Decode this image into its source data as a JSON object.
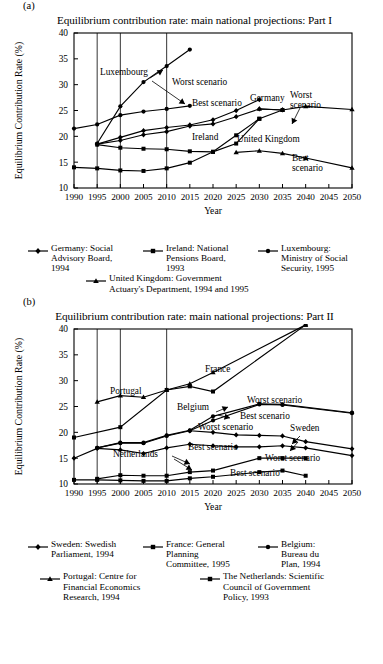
{
  "panels": [
    {
      "letter": "(a)",
      "title": "Equilibrium contribution rate: main national projections: Part I",
      "xlabel": "Year",
      "ylabel": "Equilibrium Contribution Rate (%)"
    },
    {
      "letter": "(b)",
      "title": "Equilibrium contribution rate: main national projections: Part II",
      "xlabel": "Year",
      "ylabel": "Equilibrium Contribution Rate (%)"
    }
  ],
  "chart_data": [
    {
      "type": "line",
      "title": "Equilibrium contribution rate: main national projections: Part I",
      "xlabel": "Year",
      "ylabel": "Equilibrium Contribution Rate (%)",
      "xlim": [
        1990,
        2050
      ],
      "ylim": [
        10,
        40
      ],
      "xticks": [
        1990,
        1995,
        2000,
        2005,
        2010,
        2015,
        2020,
        2025,
        2030,
        2035,
        2040,
        2045,
        2050
      ],
      "yticks": [
        10,
        15,
        20,
        25,
        30,
        35,
        40
      ],
      "gridlines_x": [
        1995,
        2000,
        2010
      ],
      "grid": "vertical-only",
      "legend_position": "below",
      "series": [
        {
          "name": "Germany: Social Advisory Board, 1994 — Worst scenario",
          "marker": "diamond",
          "x": [
            1995,
            2000,
            2005,
            2010,
            2015,
            2020,
            2025,
            2030
          ],
          "y": [
            18.5,
            19.8,
            21.1,
            21.7,
            22.2,
            23.2,
            25.0,
            27.1
          ]
        },
        {
          "name": "Germany: Social Advisory Board, 1994 — Best scenario",
          "marker": "diamond",
          "x": [
            1995,
            2000,
            2005,
            2010,
            2015,
            2020,
            2025,
            2030,
            2035
          ],
          "y": [
            18.5,
            19.2,
            20.3,
            20.9,
            22.0,
            22.4,
            23.8,
            25.3,
            25.1
          ]
        },
        {
          "name": "Ireland: National Pensions Board, 1993 — upper",
          "marker": "square",
          "x": [
            1995,
            2000,
            2005,
            2010,
            2015,
            2020,
            2025,
            2030,
            2035
          ],
          "y": [
            18.4,
            17.8,
            17.6,
            17.5,
            17.1,
            17.0,
            18.6,
            23.4,
            25.1
          ]
        },
        {
          "name": "Ireland: National Pensions Board, 1993 — lower",
          "marker": "square",
          "x": [
            1990,
            1995,
            2000,
            2005,
            2010,
            2015,
            2020,
            2025,
            2030
          ],
          "y": [
            14.0,
            13.8,
            13.4,
            13.3,
            13.8,
            14.9,
            17.0,
            20.2,
            23.4
          ]
        },
        {
          "name": "Luxembourg: Ministry of Social Security, 1995 — Worst scenario",
          "marker": "circle",
          "x": [
            1995,
            2000,
            2005,
            2010,
            2015
          ],
          "y": [
            18.6,
            25.8,
            30.5,
            33.6,
            36.8
          ]
        },
        {
          "name": "Luxembourg: Ministry of Social Security, 1995 — Best scenario",
          "marker": "circle",
          "x": [
            1990,
            1995,
            2000,
            2005,
            2010,
            2015
          ],
          "y": [
            21.5,
            22.3,
            24.1,
            24.8,
            25.3,
            25.9
          ]
        },
        {
          "name": "United Kingdom: Government Actuary's Department, 1994 and 1995 — Worst scenario",
          "marker": "triangle",
          "x": [
            2030,
            2035,
            2040,
            2050
          ],
          "y": [
            25.3,
            25.1,
            25.8,
            25.2
          ]
        },
        {
          "name": "United Kingdom: Government Actuary's Department, 1994 and 1995 — Best scenario",
          "marker": "triangle",
          "x": [
            2025,
            2030,
            2035,
            2040,
            2050
          ],
          "y": [
            16.9,
            17.2,
            16.7,
            15.8,
            13.9
          ]
        }
      ],
      "annotations": [
        "Luxembourg",
        "Worst scenario",
        "Best scenario",
        "Germany",
        "Ireland",
        "United Kingdom",
        "Worst scenario",
        "Best scenario"
      ]
    },
    {
      "type": "line",
      "title": "Equilibrium contribution rate: main national projections: Part II",
      "xlabel": "Year",
      "ylabel": "Equilibrium Contribution Rate (%)",
      "xlim": [
        1990,
        2050
      ],
      "ylim": [
        10,
        40
      ],
      "xticks": [
        1990,
        1995,
        2000,
        2005,
        2010,
        2015,
        2020,
        2025,
        2030,
        2035,
        2040,
        2045,
        2050
      ],
      "yticks": [
        10,
        15,
        20,
        25,
        30,
        35,
        40
      ],
      "gridlines_x": [
        1995,
        2000,
        2010
      ],
      "grid": "vertical-only",
      "legend_position": "below",
      "series": [
        {
          "name": "France: General Planning Committee, 1995",
          "marker": "square",
          "x": [
            1990,
            2000,
            2010,
            2015,
            2020,
            2040
          ],
          "y": [
            19.0,
            21.0,
            28.2,
            28.9,
            27.9,
            40.8
          ]
        },
        {
          "name": "Portugal: Centre for Financial Economics Research, 1994",
          "marker": "triangle",
          "x": [
            1995,
            2000,
            2005,
            2010,
            2015,
            2020,
            2040
          ],
          "y": [
            25.9,
            27.1,
            26.8,
            28.2,
            29.4,
            31.6,
            40.8
          ]
        },
        {
          "name": "Belgium: Bureau du Plan, 1994 — Worst scenario",
          "marker": "circle",
          "x": [
            1995,
            2000,
            2005,
            2010,
            2015,
            2020,
            2030,
            2035,
            2050
          ],
          "y": [
            17.0,
            18.0,
            18.0,
            19.4,
            20.4,
            23.1,
            25.5,
            25.4,
            23.8
          ]
        },
        {
          "name": "Belgium: Bureau du Plan, 1994 — Best scenario",
          "marker": "circle",
          "x": [
            1995,
            2000,
            2005,
            2010,
            2015,
            2020,
            2030,
            2035,
            2050
          ],
          "y": [
            17.0,
            17.9,
            17.9,
            19.3,
            20.3,
            22.3,
            25.4,
            25.3,
            23.7
          ]
        },
        {
          "name": "Sweden: Swedish Parliament, 1994 — Worst scenario",
          "marker": "diamond",
          "x": [
            2015,
            2020,
            2025,
            2030,
            2035,
            2040,
            2050
          ],
          "y": [
            20.3,
            20.0,
            19.5,
            19.4,
            19.3,
            18.2,
            16.8
          ]
        },
        {
          "name": "Sweden: Swedish Parliament, 1994 — Best scenario",
          "marker": "diamond",
          "x": [
            1990,
            1995,
            2000,
            2005,
            2010,
            2015,
            2020,
            2025,
            2030,
            2035,
            2040,
            2050
          ],
          "y": [
            15.0,
            16.9,
            16.6,
            15.9,
            17.0,
            17.7,
            17.4,
            17.2,
            17.2,
            17.4,
            17.0,
            15.5
          ]
        },
        {
          "name": "The Netherlands: Scientific Council of Government Policy, 1993 — Worst scenario",
          "marker": "square",
          "x": [
            1995,
            2000,
            2005,
            2010,
            2015,
            2020,
            2030,
            2035,
            2040
          ],
          "y": [
            11.0,
            11.7,
            11.6,
            11.6,
            12.3,
            12.6,
            15.0,
            15.0,
            15.0
          ]
        },
        {
          "name": "The Netherlands: Scientific Council of Government Policy, 1993 — Best scenario",
          "marker": "square",
          "x": [
            1990,
            1995,
            2000,
            2005,
            2010,
            2015,
            2020,
            2030,
            2035,
            2040
          ],
          "y": [
            10.8,
            10.8,
            10.7,
            10.6,
            10.6,
            11.1,
            11.4,
            12.3,
            12.6,
            11.6
          ]
        }
      ],
      "annotations": [
        "France",
        "Portugal",
        "Belgium",
        "Worst scenario",
        "Best scenario",
        "Worst scenario",
        "Sweden",
        "Best scenario",
        "Netherlands",
        "Worst scenario",
        "Best scenario"
      ]
    }
  ],
  "panel_a_annotations": [
    {
      "id": "ann-luxembourg",
      "text": "Luxembourg",
      "x": 32,
      "y": 41
    },
    {
      "id": "ann-worst-top",
      "text": "Worst scenario",
      "x": 57,
      "y": 50
    },
    {
      "id": "ann-best-top",
      "text": "Best scenario",
      "x": 80,
      "y": 72
    },
    {
      "id": "ann-germany",
      "text": "Germany",
      "x": 116,
      "y": 65
    },
    {
      "id": "ann-ireland",
      "text": "Ireland",
      "x": 87,
      "y": 96
    },
    {
      "id": "ann-uk",
      "text": "United Kingdom",
      "x": 115,
      "y": 98
    },
    {
      "id": "ann-worst-right",
      "text": "Worst\nscenario",
      "x": 150,
      "y": 62
    },
    {
      "id": "ann-best-right",
      "text": "Best\nscenario",
      "x": 152,
      "y": 122
    }
  ],
  "panel_b_annotations": [
    {
      "id": "ann-france",
      "text": "France"
    },
    {
      "id": "ann-portugal",
      "text": "Portugal"
    },
    {
      "id": "ann-belgium",
      "text": "Belgium"
    },
    {
      "id": "ann-worst-belgium",
      "text": "Worst scenario"
    },
    {
      "id": "ann-best-belgium",
      "text": "Best scenario"
    },
    {
      "id": "ann-worst-sweden",
      "text": "Worst scenario"
    },
    {
      "id": "ann-sweden",
      "text": "Sweden"
    },
    {
      "id": "ann-best-sweden",
      "text": "Best scenario"
    },
    {
      "id": "ann-netherlands",
      "text": "Netherlands"
    },
    {
      "id": "ann-worst-neth",
      "text": "Worst scenario"
    },
    {
      "id": "ann-best-neth",
      "text": "Best scenario"
    }
  ],
  "legend_a": {
    "row1": [
      {
        "marker": "diamond",
        "text": "Germany: Social\nAdvisory Board,\n1994"
      },
      {
        "marker": "square",
        "text": "Ireland: National\nPensions Board,\n1993"
      },
      {
        "marker": "circle",
        "text": "Luxembourg:\nMinistry of Social\nSecurity, 1995"
      }
    ],
    "row2": [
      {
        "marker": "triangle",
        "text": "United Kingdom: Government\nActuary's Department, 1994 and 1995"
      }
    ]
  },
  "legend_b": {
    "row1": [
      {
        "marker": "diamond",
        "text": "Sweden: Swedish\nParliament, 1994"
      },
      {
        "marker": "square",
        "text": "France: General\nPlanning\nCommittee, 1995"
      },
      {
        "marker": "circle",
        "text": "Belgium:\nBureau du\nPlan, 1994"
      }
    ],
    "row2": [
      {
        "marker": "triangle",
        "text": "Portugal: Centre for\nFinancial Economics\nResearch, 1994"
      },
      {
        "marker": "square",
        "text": "The Netherlands: Scientific\nCouncil of Government\nPolicy, 1993"
      }
    ]
  },
  "colors": {
    "ink": "#000000",
    "background": "#ffffff"
  }
}
